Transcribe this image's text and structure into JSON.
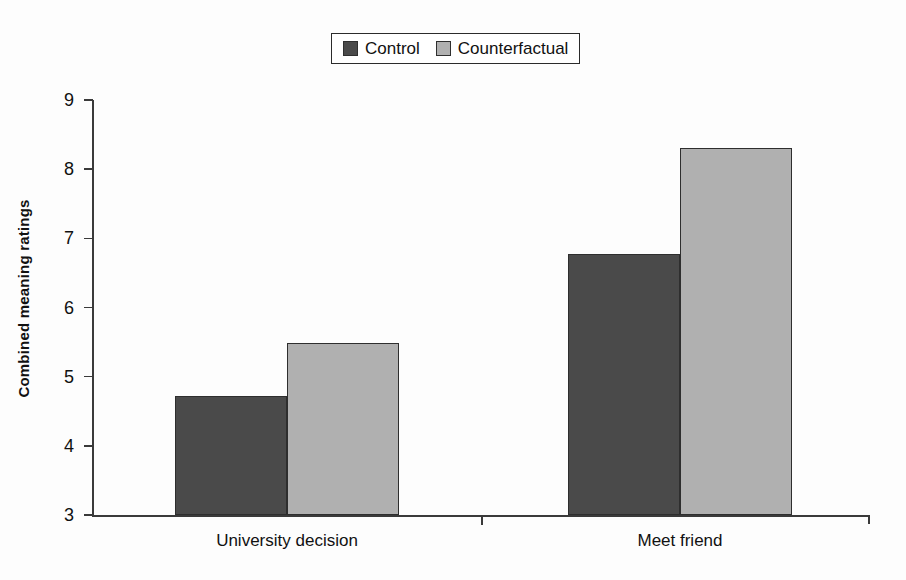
{
  "chart_data": {
    "type": "bar",
    "title": "",
    "subtitle": "",
    "xlabel": "",
    "ylabel": "Combined meaning ratings",
    "categories": [
      "University decision",
      "Meet friend"
    ],
    "series": [
      {
        "name": "Control",
        "values": [
          4.72,
          6.77
        ],
        "color": "#4a4a4a"
      },
      {
        "name": "Counterfactual",
        "values": [
          5.48,
          8.3
        ],
        "color": "#b0b0b0"
      }
    ],
    "ylim": [
      3,
      9
    ],
    "yticks": [
      3,
      4,
      5,
      6,
      7,
      8,
      9
    ],
    "ytick_labels": [
      "3",
      "4",
      "5",
      "6",
      "7",
      "8",
      "9"
    ],
    "grid": false,
    "legend_position": "top-center",
    "annotations": []
  },
  "legend": {
    "entries": [
      {
        "label": "Control",
        "swatch_name": "legend-swatch-control",
        "color": "#4a4a4a"
      },
      {
        "label": "Counterfactual",
        "swatch_name": "legend-swatch-counterfactual",
        "color": "#b0b0b0"
      }
    ]
  },
  "axes": {
    "y_title": "Combined meaning ratings",
    "y_tick_labels": [
      "9",
      "8",
      "7",
      "6",
      "5",
      "4",
      "3"
    ],
    "x_category_labels": [
      "University decision",
      "Meet friend"
    ]
  },
  "colors": {
    "control": "#4a4a4a",
    "counterfactual": "#b0b0b0",
    "axis": "#3a3a3a",
    "text": "#111111",
    "background": "#fdfdfd"
  }
}
